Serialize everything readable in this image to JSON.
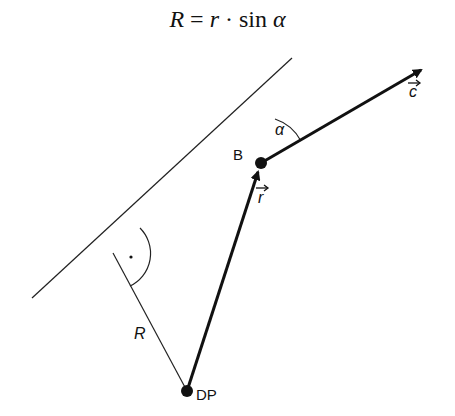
{
  "formula": {
    "lhs": "R",
    "equals": "=",
    "r": "r",
    "dot": "·",
    "func": "sin",
    "angle": "α"
  },
  "diagram": {
    "type": "vector-geometry",
    "points": {
      "B": {
        "label": "B",
        "x": 261,
        "y": 163
      },
      "DP": {
        "label": "DP",
        "x": 187,
        "y": 391
      },
      "foot": {
        "x": 113,
        "y": 253
      }
    },
    "lines": {
      "reference_line": {
        "from": [
          32,
          298
        ],
        "to": [
          292,
          58
        ]
      },
      "vector_c": {
        "label": "c",
        "from": [
          261,
          163
        ],
        "to": [
          423,
          69
        ]
      },
      "vector_r": {
        "label": "r",
        "from": [
          187,
          391
        ],
        "to": [
          261,
          163
        ]
      },
      "perpendicular_R": {
        "label": "R",
        "from": [
          113,
          253
        ],
        "to": [
          187,
          391
        ]
      }
    },
    "labels": {
      "B": "B",
      "c": "c",
      "r": "r",
      "alpha": "α",
      "R": "R",
      "DP": "DP",
      "right_angle_mark": "·"
    },
    "colors": {
      "stroke": "#111111",
      "background": "#ffffff"
    }
  }
}
